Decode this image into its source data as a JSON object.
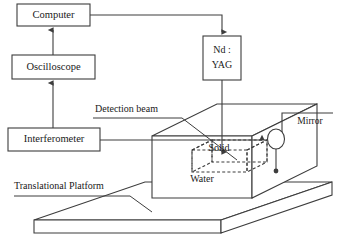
{
  "figure": {
    "kind": "experimental-setup-schematic"
  },
  "blocks": [
    {
      "id": "computer",
      "label": "Computer",
      "x": 17,
      "y": 4,
      "w": 73,
      "h": 22
    },
    {
      "id": "oscilloscope",
      "label": "Oscilloscope",
      "x": 12,
      "y": 55,
      "w": 83,
      "h": 24
    },
    {
      "id": "interferometer",
      "label": "Interferometer",
      "x": 8,
      "y": 128,
      "w": 92,
      "h": 23
    },
    {
      "id": "ndyag",
      "label_line1": "Nd :",
      "label_line2": "YAG",
      "x": 203,
      "y": 36,
      "w": 38,
      "h": 44
    }
  ],
  "annotations": {
    "detection_beam": "Detection beam",
    "translational_platform": "Translational Platform",
    "mirror": "Mirror",
    "solid": "Solid",
    "water": "Water"
  },
  "colors": {
    "stroke": "#3d3d3d",
    "text": "#1a1a1a",
    "background": "#ffffff"
  }
}
